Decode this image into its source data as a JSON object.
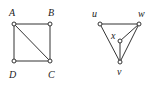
{
  "graphs": [
    {
      "id": "graph-1",
      "vertices": [
        {
          "label": "A",
          "x": 14,
          "y": 24,
          "lx": 9,
          "ly": 16
        },
        {
          "label": "B",
          "x": 50,
          "y": 24,
          "lx": 48,
          "ly": 16
        },
        {
          "label": "C",
          "x": 50,
          "y": 61,
          "lx": 48,
          "ly": 78
        },
        {
          "label": "D",
          "x": 14,
          "y": 61,
          "lx": 9,
          "ly": 78
        }
      ],
      "edges": [
        [
          "A",
          "B"
        ],
        [
          "B",
          "C"
        ],
        [
          "C",
          "D"
        ],
        [
          "D",
          "A"
        ],
        [
          "A",
          "C"
        ]
      ]
    },
    {
      "id": "graph-2",
      "vertices": [
        {
          "label": "u",
          "x": 100,
          "y": 24,
          "lx": 92,
          "ly": 17
        },
        {
          "label": "w",
          "x": 139,
          "y": 24,
          "lx": 138,
          "ly": 17
        },
        {
          "label": "x",
          "x": 120,
          "y": 41,
          "lx": 111,
          "ly": 39
        },
        {
          "label": "v",
          "x": 120,
          "y": 62,
          "lx": 117,
          "ly": 75
        }
      ],
      "edges": [
        [
          "u",
          "w"
        ],
        [
          "u",
          "v"
        ],
        [
          "w",
          "v"
        ],
        [
          "w",
          "x"
        ],
        [
          "x",
          "v"
        ]
      ]
    }
  ]
}
